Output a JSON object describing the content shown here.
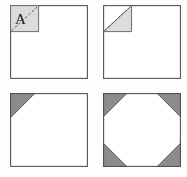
{
  "figure": {
    "panel_count": 4,
    "colors": {
      "sheet_fill": "#ffffff",
      "sheet_stroke": "#555555",
      "fold_light_fill": "#dcdcdc",
      "fold_dark_fill": "#8c8c8c",
      "crease_stroke": "#4a4a4a",
      "label_color": "#1a1a1a",
      "background": "#fdfdfd"
    },
    "panels": [
      {
        "id": "panel-1",
        "name": "square-with-corner-flap-labeled-a",
        "position": "top-left",
        "shape": "square",
        "label": "A",
        "label_position": "top-left-corner",
        "corner_regions": [
          {
            "corner": "top-left",
            "type": "square-flap",
            "shade": "light",
            "crease": "diagonal-dashed"
          }
        ]
      },
      {
        "id": "panel-2",
        "name": "square-with-folded-triangle-corner",
        "position": "top-right",
        "shape": "square",
        "label": "",
        "corner_regions": [
          {
            "corner": "top-left",
            "type": "triangle-fold",
            "shade": "light",
            "crease": "diagonal-dashed"
          }
        ]
      },
      {
        "id": "panel-3",
        "name": "square-with-one-cut-corner",
        "position": "bottom-left",
        "shape": "square",
        "label": "",
        "corner_regions": [
          {
            "corner": "top-left",
            "type": "triangle-cut",
            "shade": "dark",
            "crease": "none"
          }
        ]
      },
      {
        "id": "panel-4",
        "name": "square-with-four-cut-corners-octagon",
        "position": "bottom-right",
        "shape": "octagon",
        "label": "",
        "corner_regions": [
          {
            "corner": "top-left",
            "type": "triangle-cut",
            "shade": "dark",
            "crease": "none"
          },
          {
            "corner": "top-right",
            "type": "triangle-cut",
            "shade": "dark",
            "crease": "none"
          },
          {
            "corner": "bottom-left",
            "type": "triangle-cut",
            "shade": "dark",
            "crease": "none"
          },
          {
            "corner": "bottom-right",
            "type": "triangle-cut",
            "shade": "dark",
            "crease": "none"
          }
        ]
      }
    ]
  }
}
